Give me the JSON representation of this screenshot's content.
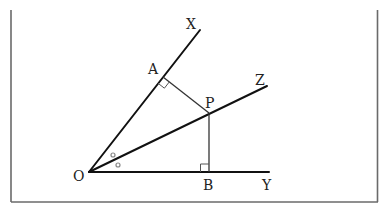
{
  "diagram": {
    "labels": {
      "O": "O",
      "A": "A",
      "B": "B",
      "P": "P",
      "X": "X",
      "Y": "Y",
      "Z": "Z"
    },
    "points": {
      "O": [
        89,
        172
      ],
      "A": [
        163,
        77
      ],
      "B": [
        209,
        172
      ],
      "P": [
        209,
        113
      ],
      "X_end": [
        200,
        30
      ],
      "Y_end": [
        269,
        172
      ],
      "Z_end": [
        267,
        86
      ]
    },
    "segments": [
      {
        "name": "ray-OX",
        "from": "O",
        "to": "X_end"
      },
      {
        "name": "ray-OY",
        "from": "O",
        "to": "Y_end"
      },
      {
        "name": "ray-OZ",
        "from": "O",
        "to": "Z_end"
      },
      {
        "name": "segment-AP",
        "from": "A",
        "to": "P"
      },
      {
        "name": "segment-PB",
        "from": "P",
        "to": "B"
      }
    ],
    "right_angles": [
      "A",
      "B"
    ],
    "equal_angle_marks": [
      "angle-XOZ",
      "angle-ZOY"
    ],
    "colors": {
      "line": "#111111",
      "frame": "#6a6a6a",
      "background": "#ffffff"
    }
  }
}
